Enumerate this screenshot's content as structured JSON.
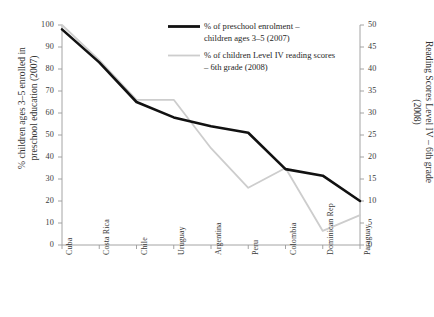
{
  "chart_data": {
    "type": "line",
    "title": "",
    "subtitle": "",
    "categories": [
      "Cuba",
      "Costa Rica",
      "Chile",
      "Uruguay",
      "Argentina",
      "Peru",
      "Colombia",
      "Dominican Rep",
      "Paraguay"
    ],
    "series": [
      {
        "name": "% of preschool enrolment – children ages 3–5 (2007)",
        "axis": "left",
        "color": "#111111",
        "width": 2.6,
        "values": [
          98,
          83,
          65,
          58,
          54,
          51,
          34.5,
          31.5,
          20
        ]
      },
      {
        "name": "% of children Level IV reading scores – 6th grade (2008)",
        "axis": "right",
        "color": "#cdcdcd",
        "width": 1.8,
        "values": [
          50,
          42,
          33,
          33,
          22,
          13,
          17.5,
          3.2,
          6.8
        ]
      }
    ],
    "xlabel": "",
    "ylabel_left": "% children ages 3–5 enrolled in\npreschool education (2007)",
    "ylabel_right": "Reading Scores Level IV – 6th grade\n(2008)",
    "ylim_left": [
      0,
      100
    ],
    "ylim_right": [
      0,
      50
    ],
    "yticks_left": [
      "0",
      "10",
      "20",
      "30",
      "40",
      "50",
      "60",
      "70",
      "80",
      "90",
      "100"
    ],
    "yticks_right": [
      "0",
      "5",
      "10",
      "15",
      "20",
      "25",
      "30",
      "35",
      "40",
      "45",
      "50"
    ],
    "grid": false,
    "legend_position": "top-center",
    "legend": [
      {
        "label": "% of preschool enrolment –\nchildren ages 3–5 (2007)",
        "color": "#111111",
        "style": "thick-solid"
      },
      {
        "label": "% of children Level IV reading scores\n– 6th grade (2008)",
        "color": "#cdcdcd",
        "style": "thin-solid"
      }
    ]
  },
  "axis_titles": {
    "left": "% children ages 3–5 enrolled in preschool education (2007)",
    "right": "Reading Scores Level IV – 6th grade (2008)"
  }
}
